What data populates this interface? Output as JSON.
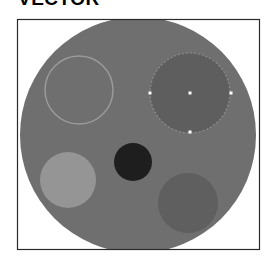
{
  "title": "VECTOR",
  "frame": {
    "x": 17.5,
    "y": 19.5,
    "width": 242,
    "height": 230,
    "stroke": "#2a2a2a"
  },
  "colors": {
    "background": "#ffffff",
    "disc": "#6f6f6f",
    "outlined_circle_stroke": "#9a9a9a",
    "selected_fill": "#5e5e5e",
    "selection_outline": "#8c8c8c",
    "handle": "#ffffff",
    "light_circle": "#959595",
    "dark_circle": "#1e1e1e",
    "lower_right_circle": "#5f5f5f"
  },
  "shapes": {
    "disc": {
      "cx": 138,
      "cy": 135,
      "r": 118
    },
    "outlined_circle": {
      "cx": 79,
      "cy": 90,
      "r": 34
    },
    "selected_circle": {
      "cx": 190,
      "cy": 93,
      "r": 40
    },
    "light_circle": {
      "cx": 68,
      "cy": 180,
      "r": 28
    },
    "dark_circle": {
      "cx": 133,
      "cy": 162,
      "r": 19
    },
    "lower_right_circle": {
      "cx": 188,
      "cy": 203,
      "r": 30
    }
  },
  "handles": [
    {
      "name": "left",
      "x": 150,
      "y": 93
    },
    {
      "name": "center",
      "x": 190,
      "y": 93
    },
    {
      "name": "right",
      "x": 231,
      "y": 93
    },
    {
      "name": "bottom",
      "x": 190,
      "y": 132
    }
  ]
}
